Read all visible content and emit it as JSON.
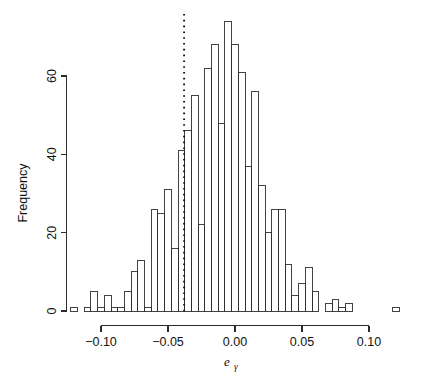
{
  "chart_data": {
    "type": "bar",
    "subtype": "histogram",
    "title": "",
    "xlabel": "eγ",
    "xlabel_base": "e",
    "xlabel_subscript": "γ",
    "ylabel": "Frequency",
    "xlim": [
      -0.1225,
      0.1275
    ],
    "ylim": [
      0,
      76
    ],
    "xticks": [
      -0.1,
      -0.05,
      0.0,
      0.05,
      0.1
    ],
    "xtick_labels": [
      "-0.10",
      "-0.05",
      "0.00",
      "0.05",
      "0.10"
    ],
    "yticks": [
      0,
      20,
      40,
      60
    ],
    "ytick_labels": [
      "0",
      "20",
      "40",
      "60"
    ],
    "grid": false,
    "legend": null,
    "bin_width": 0.005,
    "bin_left_edges": [
      -0.1225,
      -0.1175,
      -0.1125,
      -0.1075,
      -0.1025,
      -0.0975,
      -0.0925,
      -0.0875,
      -0.0825,
      -0.0775,
      -0.0725,
      -0.0675,
      -0.0625,
      -0.0575,
      -0.0525,
      -0.0475,
      -0.0425,
      -0.0375,
      -0.0325,
      -0.0275,
      -0.0225,
      -0.0175,
      -0.0125,
      -0.0075,
      -0.0025,
      0.0025,
      0.0075,
      0.0125,
      0.0175,
      0.0225,
      0.0275,
      0.0325,
      0.0375,
      0.0425,
      0.0475,
      0.0525,
      0.0575,
      0.0625,
      0.0675,
      0.0725,
      0.0775,
      0.0825,
      0.0875,
      0.0925,
      0.0975,
      0.1025,
      0.1075,
      0.1125,
      0.1175,
      0.1225
    ],
    "values": [
      1,
      0,
      1,
      5,
      1,
      4,
      1,
      1,
      5,
      10,
      13,
      1,
      26,
      25,
      31,
      16,
      41,
      46,
      55,
      22,
      62,
      68,
      48,
      74,
      68,
      61,
      37,
      56,
      32,
      20,
      26,
      26,
      12,
      4,
      7,
      11,
      5,
      0,
      2,
      3,
      1,
      2,
      0,
      0,
      0,
      0,
      0,
      0,
      1,
      0
    ],
    "annotations": [
      {
        "name": "vertical-dotted-reference-line",
        "type": "vline",
        "x": -0.038,
        "style": "dotted"
      }
    ]
  },
  "axes": {
    "y_title": "Frequency",
    "x_title_base": "e",
    "x_title_sub": "γ"
  },
  "colors": {
    "background": "#ffffff",
    "foreground": "#1a1a1a",
    "bar_stroke": "#2f2f2f",
    "vline": "#111111"
  }
}
